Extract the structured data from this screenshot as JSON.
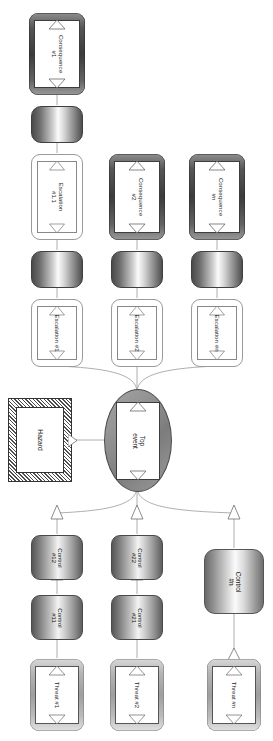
{
  "diagram": {
    "orientation": "rotated-90",
    "colors": {
      "line": "#8c8c8c",
      "consequence_frame": "#3b3b3b",
      "threat_frame": "#9e9e9e",
      "hazard_hatch": "#4d4d4d",
      "top_event_fill": "#8d8d8d",
      "inner_fill": "#ffffff"
    }
  },
  "hazard": {
    "label": "Hazard"
  },
  "top_event": {
    "label_line1": "Top",
    "label_line2": "event"
  },
  "consequences": [
    {
      "label_line1": "Consequence",
      "label_line2": "#1"
    },
    {
      "label_line1": "Consequence",
      "label_line2": "#2"
    },
    {
      "label_line1": "Consequence",
      "label_line2": "#n"
    }
  ],
  "escalations_upper": [
    {
      "label_line1": "Escalation",
      "label_line2": "#1.1"
    }
  ],
  "escalations": [
    {
      "label": "Escalation #1"
    },
    {
      "label": "Escalation #2"
    },
    {
      "label": "Escalation #n"
    }
  ],
  "recovery_barriers": [
    {
      "label": ""
    },
    {
      "label": ""
    },
    {
      "label": ""
    },
    {
      "label": ""
    }
  ],
  "controls": [
    {
      "label_line1": "Control",
      "label_line2": "#12"
    },
    {
      "label_line1": "Control",
      "label_line2": "#22"
    },
    {
      "label_line1": "Control",
      "label_line2": "#n"
    },
    {
      "label_line1": "Control",
      "label_line2": "#11"
    },
    {
      "label_line1": "Control",
      "label_line2": "#21"
    }
  ],
  "threats": [
    {
      "label": "Threat #1"
    },
    {
      "label": "Threat #2"
    },
    {
      "label": "Threat #n"
    }
  ]
}
